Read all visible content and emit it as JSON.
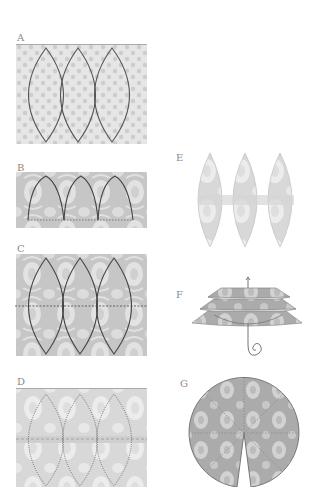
{
  "steps": [
    {
      "id": "A",
      "label": "A",
      "description": "Three overlapping lens (vesica) shapes drawn on dotted patterned paper"
    },
    {
      "id": "B",
      "label": "B",
      "description": "Three pointed-arch shapes on damask paper with dotted fold line at base"
    },
    {
      "id": "C",
      "label": "C",
      "description": "Three lens shapes on damask paper with horizontal dotted center line"
    },
    {
      "id": "D",
      "label": "D",
      "description": "Folded sheet showing dotted cut lines of three lens shapes with center fold band"
    },
    {
      "id": "E",
      "label": "E",
      "description": "Cut-out strip of three joined lens shapes"
    },
    {
      "id": "F",
      "label": "F",
      "description": "Stacked layered lantern pieces threaded on a curled string"
    },
    {
      "id": "G",
      "label": "G",
      "description": "Circular patterned piece divided into segments with a wedge cut out at the bottom"
    }
  ],
  "colors": {
    "paper_light": "#e4e4e4",
    "paper_dot": "#cfcfcf",
    "damask_bg": "#c9c9c9",
    "damask_motif": "#e6e6e6",
    "outline": "#555555",
    "label": "#8a8a8a"
  }
}
